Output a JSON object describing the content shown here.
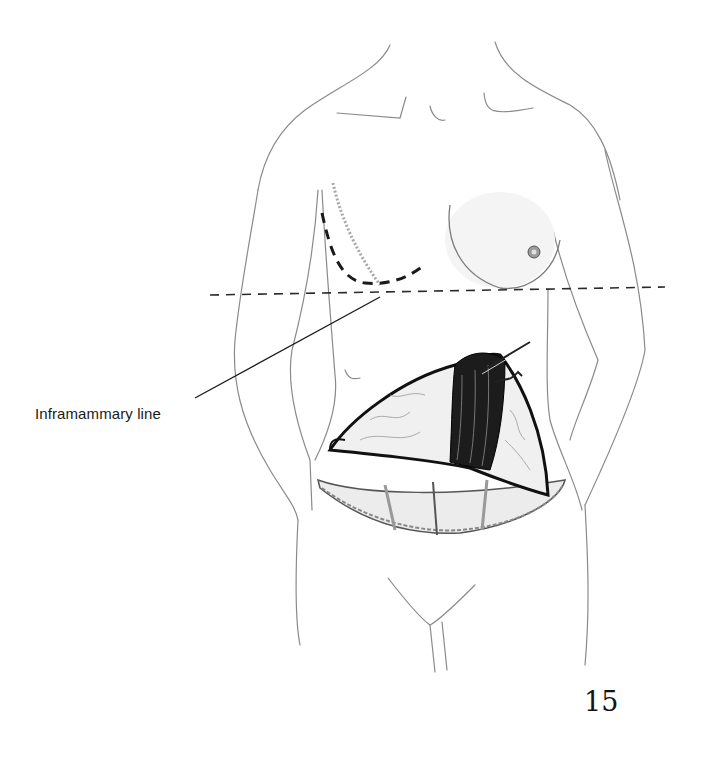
{
  "figure": {
    "labels": {
      "inframammary": "Inframammary line"
    },
    "page_number": "15",
    "colors": {
      "outline": "#8a8a8a",
      "ink": "#1a1a1a",
      "shading": "#cfcfcf"
    }
  }
}
